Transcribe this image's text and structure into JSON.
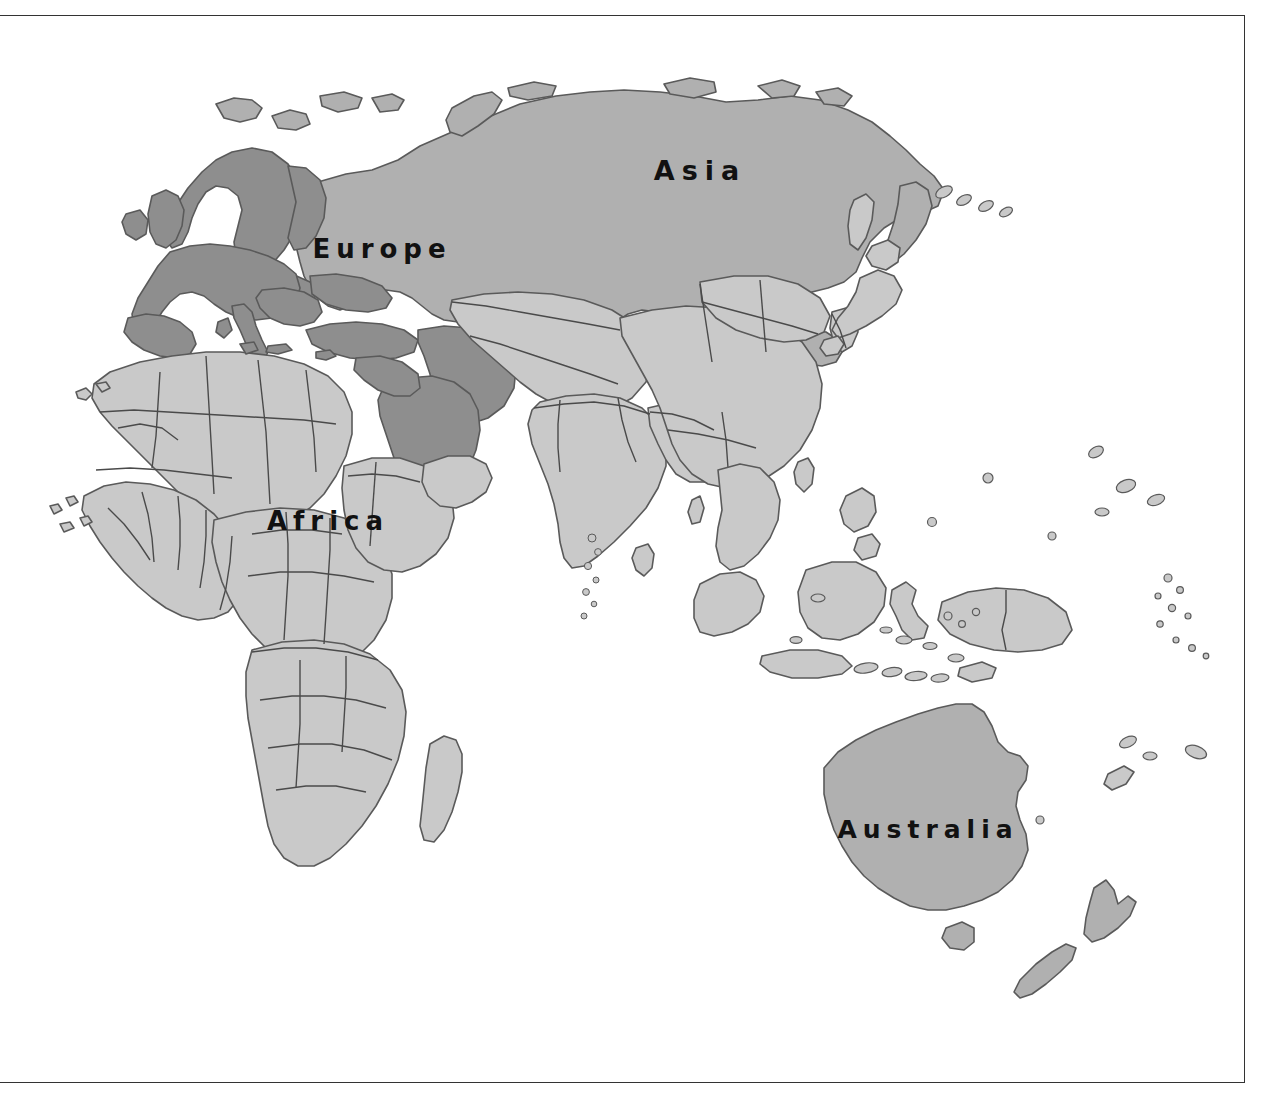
{
  "map": {
    "title": "World map of the Eastern Hemisphere",
    "projection_hint": "equirectangular-eastern-hemisphere",
    "background_color": "#ffffff",
    "frame": {
      "stroke_color": "#333333",
      "stroke_width": 1.5,
      "open_side": "left"
    },
    "palette": {
      "ocean": "#ffffff",
      "land_light": "#c9c9c9",
      "land_medium": "#b0b0b0",
      "land_dark": "#8e8e8e",
      "border_stroke": "#4a4a4a",
      "coast_stroke": "#5a5a5a",
      "label_text": "#111111"
    },
    "labels": [
      {
        "name": "asia",
        "text": "Asia",
        "x": 700,
        "y": 180
      },
      {
        "name": "europe",
        "text": "Europe",
        "x": 318,
        "y": 258
      },
      {
        "name": "africa",
        "text": "Africa",
        "x": 268,
        "y": 530
      },
      {
        "name": "australia",
        "text": "Australia",
        "x": 838,
        "y": 840
      }
    ],
    "regions": [
      {
        "name": "europe",
        "shade": "land_dark"
      },
      {
        "name": "russia",
        "shade": "land_medium"
      },
      {
        "name": "middle-east",
        "shade": "land_dark"
      },
      {
        "name": "africa",
        "shade": "land_light"
      },
      {
        "name": "south-asia",
        "shade": "land_light"
      },
      {
        "name": "east-asia",
        "shade": "land_light"
      },
      {
        "name": "southeast-asia",
        "shade": "land_light"
      },
      {
        "name": "australia",
        "shade": "land_medium"
      },
      {
        "name": "new-zealand",
        "shade": "land_medium"
      }
    ]
  }
}
